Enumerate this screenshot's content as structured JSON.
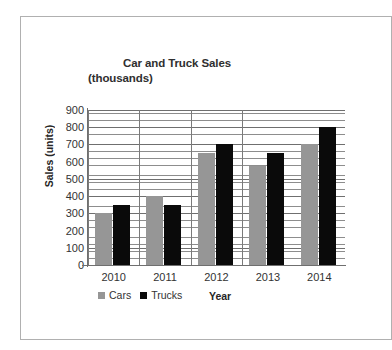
{
  "chart_data": {
    "type": "bar",
    "title": "Car and Truck Sales",
    "subtitle": "(thousands)",
    "xlabel": "Year",
    "ylabel": "Sales (units)",
    "categories": [
      "2010",
      "2011",
      "2012",
      "2013",
      "2014"
    ],
    "series": [
      {
        "name": "Cars",
        "color": "#969696",
        "values": [
          300,
          400,
          650,
          575,
          700
        ]
      },
      {
        "name": "Trucks",
        "color": "#0a0a0a",
        "values": [
          350,
          350,
          700,
          650,
          800
        ]
      }
    ],
    "ylim": [
      0,
      900
    ],
    "ytick_labels": [
      "900",
      "800",
      "700",
      "600",
      "500",
      "400",
      "300",
      "200",
      "100",
      "0"
    ],
    "ytick_values": [
      900,
      800,
      700,
      600,
      500,
      400,
      300,
      200,
      100,
      0
    ],
    "ytick_step": 100,
    "minor_gridline_step": 20,
    "grid": true,
    "legend_position": "bottom-left",
    "legend": [
      {
        "label": "Cars",
        "swatch": "#969696"
      },
      {
        "label": "Trucks",
        "swatch": "#0a0a0a"
      }
    ]
  },
  "frame": {
    "border_color": "#b0b0b0",
    "background": "#ffffff"
  }
}
